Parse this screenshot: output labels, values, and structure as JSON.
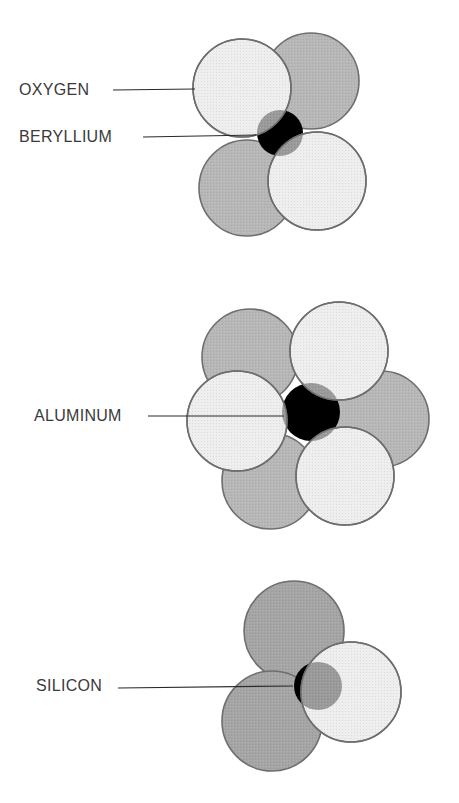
{
  "diagram": {
    "type": "ion coordination polyhedra (cation surrounded by oxygen anions)",
    "colors": {
      "background": "#ffffff",
      "oxygen_light": "#eeeeee",
      "oxygen_dark": "#b7b7b7",
      "oxygen_dark_si": "#a5a5a5",
      "outline": "#6e6e6e",
      "cation": "#000000",
      "cation_halo": "#9a9a9a",
      "leader_line": "#2a2a2a",
      "label_text": "#3a3a3a"
    },
    "panels": [
      {
        "id": "beryllium",
        "labels": [
          {
            "text": "OXYGEN",
            "x": 19,
            "y": 82,
            "line": [
              113,
              90,
              195,
              89
            ]
          },
          {
            "text": "BERYLLIUM",
            "x": 19,
            "y": 129,
            "line": [
              143,
              137,
              256,
              135
            ]
          }
        ],
        "back_circles": [
          {
            "cx": 311,
            "cy": 81,
            "r": 48,
            "shade": "dark"
          },
          {
            "cx": 247,
            "cy": 188,
            "r": 48,
            "shade": "dark"
          }
        ],
        "cation": {
          "cx": 280,
          "cy": 133,
          "r": 23
        },
        "front_circles": [
          {
            "cx": 242,
            "cy": 88,
            "r": 49,
            "shade": "light"
          },
          {
            "cx": 317,
            "cy": 181,
            "r": 49,
            "shade": "light"
          }
        ]
      },
      {
        "id": "aluminum",
        "labels": [
          {
            "text": "ALUMINUM",
            "x": 34,
            "y": 408,
            "line": [
              148,
              416,
              284,
              416
            ]
          }
        ],
        "back_circles": [
          {
            "cx": 250,
            "cy": 357,
            "r": 48,
            "shade": "dark"
          },
          {
            "cx": 381,
            "cy": 419,
            "r": 48,
            "shade": "dark"
          },
          {
            "cx": 270,
            "cy": 481,
            "r": 48,
            "shade": "dark"
          }
        ],
        "cation": {
          "cx": 311,
          "cy": 412,
          "r": 29
        },
        "front_circles": [
          {
            "cx": 339,
            "cy": 351,
            "r": 49,
            "shade": "light"
          },
          {
            "cx": 237,
            "cy": 421,
            "r": 50,
            "shade": "light"
          },
          {
            "cx": 345,
            "cy": 476,
            "r": 49,
            "shade": "light"
          }
        ]
      },
      {
        "id": "silicon",
        "labels": [
          {
            "text": "SILICON",
            "x": 36,
            "y": 678,
            "line": [
              118,
              688,
              293,
              686
            ]
          }
        ],
        "back_circles": [
          {
            "cx": 294,
            "cy": 631,
            "r": 50,
            "shade": "darker"
          },
          {
            "cx": 272,
            "cy": 721,
            "r": 50,
            "shade": "darker"
          }
        ],
        "cation": {
          "cx": 318,
          "cy": 686,
          "r": 24
        },
        "front_circles": [
          {
            "cx": 351,
            "cy": 692,
            "r": 50,
            "shade": "light"
          }
        ]
      }
    ]
  }
}
